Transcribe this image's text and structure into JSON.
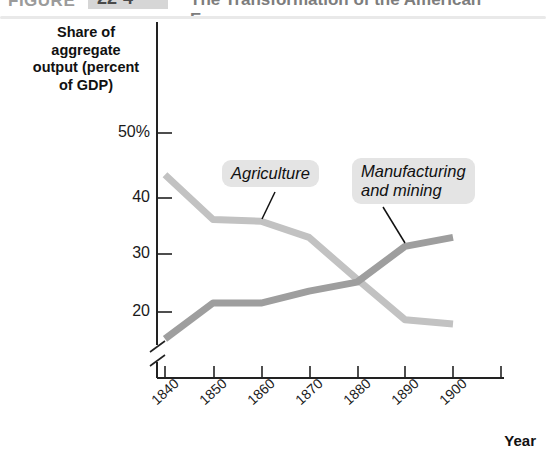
{
  "caption": {
    "label": "FIGURE",
    "number": "22-4",
    "title": "The Transformation of the American Economy"
  },
  "axis_title": "Share of\naggregate\noutput (percent\nof GDP)",
  "x_axis_label": "Year",
  "colors": {
    "agriculture_line": "#c2c2c2",
    "manufacturing_line": "#9e9e9e",
    "callout_background": "#e4e4e4",
    "axis": "#222222"
  },
  "callouts": {
    "agriculture": "Agriculture",
    "manufacturing": "Manufacturing\nand mining"
  },
  "chart_data": {
    "type": "line",
    "title": "",
    "xlabel": "Year",
    "ylabel": "Share of aggregate output (percent of GDP)",
    "x": [
      1840,
      1850,
      1860,
      1870,
      1880,
      1890,
      1900
    ],
    "xtick_labels": [
      "1840",
      "1850",
      "1860",
      "1870",
      "1880",
      "1890",
      "1900"
    ],
    "ytick_labels": [
      "50%",
      "40",
      "30",
      "20"
    ],
    "yticks": [
      50,
      40,
      30,
      20
    ],
    "ylim": [
      14,
      53
    ],
    "axis_break": true,
    "grid": false,
    "legend": "inline-callouts",
    "series": [
      {
        "name": "Agriculture",
        "color": "#c2c2c2",
        "values": [
          43.0,
          35.5,
          35.2,
          32.5,
          25.5,
          18.7,
          18.0
        ]
      },
      {
        "name": "Manufacturing and mining",
        "color": "#9e9e9e",
        "values": [
          15.5,
          21.5,
          21.5,
          23.5,
          25.0,
          31.0,
          32.5
        ]
      }
    ]
  }
}
